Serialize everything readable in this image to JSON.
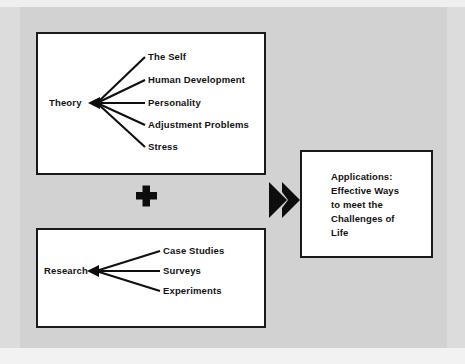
{
  "diagram": {
    "type": "concept-flow",
    "background_color": "#d2d2d2",
    "box_fill_color": "#ffffff",
    "line_color": "#101010",
    "boxes": [
      {
        "id": "theory",
        "name": "theory-box",
        "root_label": "Theory",
        "branches": [
          "The Self",
          "Human Development",
          "Personality",
          "Adjustment Problems",
          "Stress"
        ]
      },
      {
        "id": "research",
        "name": "research-box",
        "root_label": "Research",
        "branches": [
          "Case Studies",
          "Surveys",
          "Experiments"
        ]
      },
      {
        "id": "applications",
        "name": "applications-box",
        "lines": [
          "Applications:",
          "Effective Ways",
          "to meet the",
          "Challenges of",
          "Life"
        ]
      }
    ],
    "operators": [
      {
        "name": "plus-icon",
        "symbol": "+"
      },
      {
        "name": "double-arrow-right-icon",
        "symbol": "▶▶"
      }
    ]
  }
}
